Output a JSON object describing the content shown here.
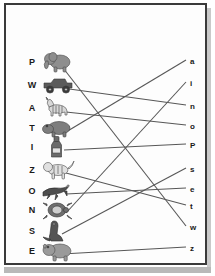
{
  "page": {
    "type": "matching-worksheet",
    "background_color": "#ffffff",
    "frame_color": "#3a3a3a",
    "line_color": "#575757",
    "text_color": "#1a1a1a"
  },
  "left_column": [
    {
      "label": "P",
      "icon": "elephant-icon",
      "x": 30,
      "y": 62
    },
    {
      "label": "W",
      "icon": "jeep-icon",
      "x": 30,
      "y": 85
    },
    {
      "label": "A",
      "icon": "zebra-icon",
      "x": 30,
      "y": 108
    },
    {
      "label": "T",
      "icon": "hippo-icon",
      "x": 30,
      "y": 128
    },
    {
      "label": "I",
      "icon": "bottle-icon",
      "x": 30,
      "y": 147
    },
    {
      "label": "Z",
      "icon": "tiger-icon",
      "x": 30,
      "y": 170
    },
    {
      "label": "O",
      "icon": "dragon-icon",
      "x": 30,
      "y": 191
    },
    {
      "label": "N",
      "icon": "turtle-icon",
      "x": 30,
      "y": 210
    },
    {
      "label": "S",
      "icon": "seal-icon",
      "x": 30,
      "y": 231
    },
    {
      "label": "E",
      "icon": "rhino-icon",
      "x": 30,
      "y": 251
    }
  ],
  "right_column": [
    {
      "label": "a",
      "x": 192,
      "y": 62
    },
    {
      "label": "i",
      "x": 192,
      "y": 84
    },
    {
      "label": "n",
      "x": 192,
      "y": 107
    },
    {
      "label": "o",
      "x": 192,
      "y": 127
    },
    {
      "label": "P",
      "x": 192,
      "y": 146
    },
    {
      "label": "s",
      "x": 192,
      "y": 170
    },
    {
      "label": "e",
      "x": 192,
      "y": 190
    },
    {
      "label": "t",
      "x": 192,
      "y": 207
    },
    {
      "label": "w",
      "x": 192,
      "y": 228
    },
    {
      "label": "z",
      "x": 192,
      "y": 249
    }
  ],
  "connections": [
    {
      "from": "P",
      "to": "w",
      "x1": 60,
      "y1": 64,
      "x2": 186,
      "y2": 226
    },
    {
      "from": "W",
      "to": "n",
      "x1": 62,
      "y1": 88,
      "x2": 186,
      "y2": 105
    },
    {
      "from": "A",
      "to": "o",
      "x1": 66,
      "y1": 112,
      "x2": 186,
      "y2": 125
    },
    {
      "from": "T",
      "to": "a",
      "x1": 66,
      "y1": 132,
      "x2": 186,
      "y2": 60
    },
    {
      "from": "I",
      "to": "P",
      "x1": 64,
      "y1": 150,
      "x2": 186,
      "y2": 144
    },
    {
      "from": "Z",
      "to": "t",
      "x1": 66,
      "y1": 173,
      "x2": 186,
      "y2": 205
    },
    {
      "from": "O",
      "to": "e",
      "x1": 66,
      "y1": 194,
      "x2": 186,
      "y2": 188
    },
    {
      "from": "N",
      "to": "i",
      "x1": 66,
      "y1": 213,
      "x2": 186,
      "y2": 82
    },
    {
      "from": "S",
      "to": "s",
      "x1": 62,
      "y1": 234,
      "x2": 186,
      "y2": 168
    },
    {
      "from": "E",
      "to": "z",
      "x1": 62,
      "y1": 254,
      "x2": 186,
      "y2": 247
    }
  ]
}
